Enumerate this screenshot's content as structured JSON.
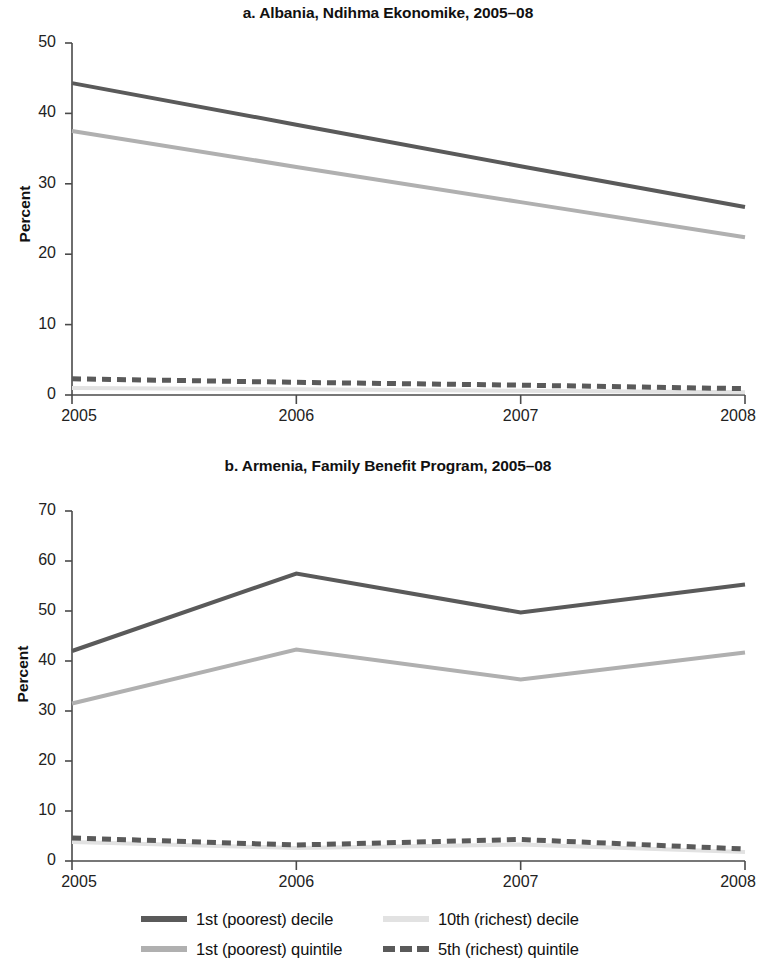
{
  "figure": {
    "y_axis_label": "Percent"
  },
  "legend": {
    "rows": [
      [
        {
          "label": "1st (poorest) decile",
          "color": "#5a5a5a",
          "style": "solid"
        },
        {
          "label": "10th (richest) decile",
          "color": "#e2e2e2",
          "style": "solid"
        }
      ],
      [
        {
          "label": "1st (poorest) quintile",
          "color": "#b0b0b0",
          "style": "solid"
        },
        {
          "label": "5th (richest) quintile",
          "color": "#5a5a5a",
          "style": "dashed"
        }
      ]
    ]
  },
  "chart_data": [
    {
      "type": "line",
      "panel": "a",
      "title": "a. Albania, Ndihma Ekonomike, 2005–08",
      "xlabel": "",
      "ylabel": "Percent",
      "x": [
        "2005",
        "2006",
        "2007",
        "2008"
      ],
      "xtick_labels": [
        "2005",
        "2006",
        "2007",
        "2008"
      ],
      "ytick_labels": [
        "0",
        "10",
        "20",
        "30",
        "40",
        "50"
      ],
      "ylim": [
        0,
        50
      ],
      "yticks": [
        0,
        10,
        20,
        30,
        40,
        50
      ],
      "grid": false,
      "legend_position": "below figure",
      "series": [
        {
          "name": "1st (poorest) decile",
          "values": [
            44.3,
            38.4,
            32.5,
            26.7
          ],
          "color": "#5a5a5a",
          "style": "solid"
        },
        {
          "name": "1st (poorest) quintile",
          "values": [
            37.5,
            32.4,
            27.4,
            22.4
          ],
          "color": "#b0b0b0",
          "style": "solid"
        },
        {
          "name": "5th (richest) quintile",
          "values": [
            2.3,
            1.8,
            1.4,
            0.9
          ],
          "color": "#5a5a5a",
          "style": "dashed"
        },
        {
          "name": "10th (richest) decile",
          "values": [
            1.0,
            0.8,
            0.6,
            0.4
          ],
          "color": "#e2e2e2",
          "style": "solid"
        }
      ]
    },
    {
      "type": "line",
      "panel": "b",
      "title": "b. Armenia, Family Benefit Program, 2005–08",
      "xlabel": "",
      "ylabel": "Percent",
      "x": [
        "2005",
        "2006",
        "2007",
        "2008"
      ],
      "xtick_labels": [
        "2005",
        "2006",
        "2007",
        "2008"
      ],
      "ytick_labels": [
        "0",
        "10",
        "20",
        "30",
        "40",
        "50",
        "60",
        "70"
      ],
      "ylim": [
        0,
        70
      ],
      "yticks": [
        0,
        10,
        20,
        30,
        40,
        50,
        60,
        70
      ],
      "grid": false,
      "legend_position": "below figure",
      "series": [
        {
          "name": "1st (poorest) decile",
          "values": [
            42.0,
            57.5,
            49.7,
            55.3
          ],
          "color": "#5a5a5a",
          "style": "solid"
        },
        {
          "name": "1st (poorest) quintile",
          "values": [
            31.5,
            42.3,
            36.3,
            41.7
          ],
          "color": "#b0b0b0",
          "style": "solid"
        },
        {
          "name": "5th (richest) quintile",
          "values": [
            4.6,
            3.2,
            4.3,
            2.4
          ],
          "color": "#5a5a5a",
          "style": "dashed"
        },
        {
          "name": "10th (richest) decile",
          "values": [
            3.8,
            2.6,
            3.3,
            1.8
          ],
          "color": "#e2e2e2",
          "style": "solid"
        }
      ]
    }
  ]
}
